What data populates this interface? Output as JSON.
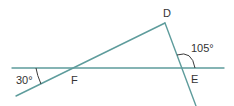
{
  "diagram": {
    "type": "geometry",
    "line_color": "#5e9c9c",
    "label_color": "#333333",
    "points": {
      "D": {
        "label": "D",
        "x": 165,
        "y": 23
      },
      "E": {
        "label": "E",
        "x": 181,
        "y": 68
      },
      "F": {
        "label": "F",
        "x": 73,
        "y": 68
      }
    },
    "lines": [
      {
        "name": "horizontal-line",
        "from": [
          12,
          68
        ],
        "to": [
          224,
          68
        ]
      },
      {
        "name": "line-through-F-to-D",
        "from": [
          16,
          96
        ],
        "to": [
          165,
          23
        ]
      },
      {
        "name": "line-D-through-E",
        "from": [
          165,
          23
        ],
        "to": [
          196,
          106
        ]
      }
    ],
    "angles": [
      {
        "label": "30°",
        "value": 30,
        "location": "left intersection, between horizontal line and line through F"
      },
      {
        "label": "105°",
        "value": 105,
        "location": "at E, between line DE and horizontal line to the right"
      }
    ]
  }
}
